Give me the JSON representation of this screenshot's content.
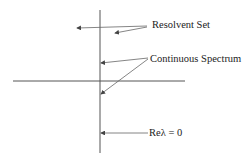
{
  "diagram": {
    "labels": {
      "resolvent_set": "Resolvent Set",
      "continuous_spectrum": "Continuous Spectrum",
      "re_lambda_zero": "Reλ = 0"
    },
    "colors": {
      "line": "#555555",
      "text": "#222222",
      "background": "#ffffff"
    }
  }
}
